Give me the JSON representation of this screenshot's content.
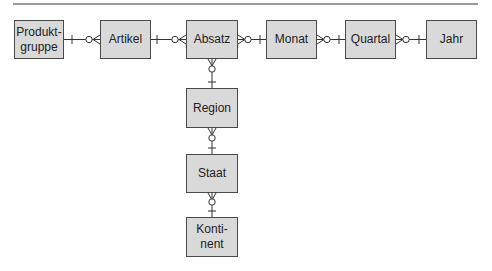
{
  "diagram": {
    "type": "entity-relationship (crow's foot notation)",
    "colors": {
      "entity_fill": "#d9d9d9",
      "entity_border": "#4a4a4a",
      "line": "#333333",
      "rule": "#9a9a9a"
    },
    "entities": [
      {
        "id": "produktgruppe",
        "label": "Produkt-\ngruppe",
        "x": 14,
        "y": 20,
        "w": 50,
        "h": 39
      },
      {
        "id": "artikel",
        "label": "Artikel",
        "x": 100,
        "y": 20,
        "w": 51,
        "h": 39
      },
      {
        "id": "absatz",
        "label": "Absatz",
        "x": 186,
        "y": 20,
        "w": 52,
        "h": 39
      },
      {
        "id": "monat",
        "label": "Monat",
        "x": 266,
        "y": 20,
        "w": 51,
        "h": 39
      },
      {
        "id": "quartal",
        "label": "Quartal",
        "x": 345,
        "y": 20,
        "w": 51,
        "h": 39
      },
      {
        "id": "jahr",
        "label": "Jahr",
        "x": 426,
        "y": 20,
        "w": 51,
        "h": 39
      },
      {
        "id": "region",
        "label": "Region",
        "x": 186,
        "y": 88,
        "w": 52,
        "h": 40
      },
      {
        "id": "staat",
        "label": "Staat",
        "x": 186,
        "y": 154,
        "w": 52,
        "h": 39
      },
      {
        "id": "kontinent",
        "label": "Konti-\nnent",
        "x": 186,
        "y": 217,
        "w": 52,
        "h": 40
      }
    ],
    "relationships": [
      {
        "one": "produktgruppe",
        "many": "artikel",
        "one_end": "one",
        "many_end": "zero-or-many"
      },
      {
        "one": "artikel",
        "many": "absatz",
        "one_end": "one",
        "many_end": "zero-or-many"
      },
      {
        "one": "monat",
        "many": "absatz",
        "one_end": "one",
        "many_end": "zero-or-many"
      },
      {
        "one": "quartal",
        "many": "monat",
        "one_end": "one",
        "many_end": "zero-or-many"
      },
      {
        "one": "jahr",
        "many": "quartal",
        "one_end": "one",
        "many_end": "zero-or-many"
      },
      {
        "one": "region",
        "many": "absatz",
        "one_end": "one",
        "many_end": "zero-or-many"
      },
      {
        "one": "staat",
        "many": "region",
        "one_end": "one",
        "many_end": "zero-or-many"
      },
      {
        "one": "kontinent",
        "many": "staat",
        "one_end": "one",
        "many_end": "zero-or-many"
      }
    ]
  }
}
